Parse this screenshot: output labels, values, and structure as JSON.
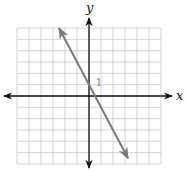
{
  "chart_data": {
    "type": "line",
    "title": "",
    "xlabel": "x",
    "ylabel": "y",
    "xlim": [
      -6,
      6
    ],
    "ylim": [
      -6,
      6
    ],
    "grid": true,
    "grid_step": 1,
    "annotations": [
      {
        "text": "1",
        "x": 0.3,
        "y": 1,
        "meaning": "tick label for y = 1"
      }
    ],
    "series": [
      {
        "name": "line",
        "equation": "y = -2x + 1",
        "slope": -2,
        "intercept": 1,
        "x": [
          -2.5,
          3.25
        ],
        "y": [
          6,
          -5.5
        ],
        "arrows_both_ends": true,
        "color": "#7a7a7a"
      }
    ],
    "colors": {
      "grid": "#c8c8c8",
      "axes": "#111111",
      "label": "#888888"
    }
  }
}
